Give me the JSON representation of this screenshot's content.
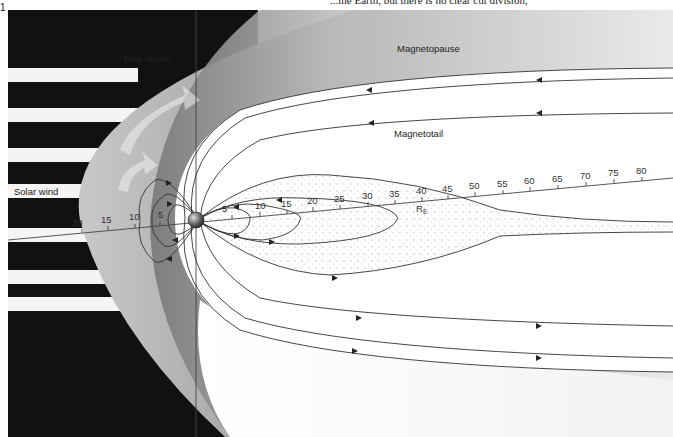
{
  "page": {
    "top_text": "...the Earth, but there is no clear cut division,",
    "figure_number": "1"
  },
  "labels": {
    "bow_shock": "Bow shock",
    "magnetopause": "Magnetopause",
    "magnetotail": "Magnetotail",
    "solar_wind": "Solar wind",
    "unit": "R",
    "unit_sub": "E"
  },
  "axis": {
    "sunward_ticks": [
      "20",
      "15",
      "10",
      "5"
    ],
    "tailward_ticks": [
      "5",
      "10",
      "15",
      "20",
      "25",
      "30",
      "35",
      "40",
      "45",
      "50",
      "55",
      "60",
      "65",
      "70",
      "75",
      "80"
    ]
  },
  "colors": {
    "background": "#ffffff",
    "dark_space": "#111111",
    "sheath_gray": "#9a9a9a",
    "field_line": "#333333",
    "earth": "#555555"
  }
}
